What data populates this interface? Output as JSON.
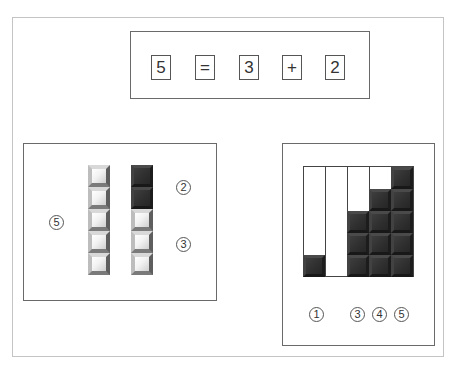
{
  "equation": {
    "symbols": [
      "5",
      "=",
      "3",
      "+",
      "2"
    ]
  },
  "left_panel": {
    "total_label": "5",
    "top_label": "2",
    "bottom_label": "3",
    "columns": [
      {
        "tiles": [
          "light",
          "light",
          "light",
          "light",
          "light"
        ]
      },
      {
        "tiles": [
          "dark",
          "dark",
          "light",
          "light",
          "light"
        ]
      }
    ]
  },
  "right_panel": {
    "columns": [
      {
        "filled": 1,
        "label": "1"
      },
      {
        "filled": 0,
        "label": ""
      },
      {
        "filled": 3,
        "label": "3"
      },
      {
        "filled": 4,
        "label": "4"
      },
      {
        "filled": 5,
        "label": "5"
      }
    ],
    "labels": [
      "1",
      "3",
      "4",
      "5"
    ]
  },
  "colors": {
    "dark_tile": "#2e2e2e",
    "light_tile": "#f2f2f2",
    "border": "#6a6a6a"
  }
}
